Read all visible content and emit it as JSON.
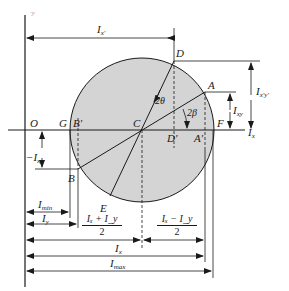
{
  "diagram": {
    "colors": {
      "circle_fill": "#d4d4d4",
      "line": "#1a1a1a",
      "background": "#ffffff"
    },
    "axes": {
      "vertical_label": "I_xy",
      "vertical_label_text": "·y",
      "horizontal_label": "I",
      "horizontal_label_sub": "x"
    },
    "points": {
      "O": "O",
      "G": "G",
      "B_prime": "B′",
      "C": "C",
      "D_prime": "D′",
      "A_prime": "A′",
      "F": "F",
      "D": "D",
      "A": "A",
      "B": "B",
      "E": "E"
    },
    "angles": {
      "two_theta": "2θ",
      "two_beta": "2β"
    },
    "dimensions": {
      "Ixprime": {
        "main": "I",
        "sub": "x′"
      },
      "Ixprimeyprime": {
        "main": "I",
        "sub": "x′y′"
      },
      "Ixy": {
        "main": "I",
        "sub": "xy"
      },
      "neg_Ixy": {
        "main": "−I",
        "sub": "xy"
      },
      "Imin": {
        "main": "I",
        "sub": "min"
      },
      "Iy": {
        "main": "I",
        "sub": "y"
      },
      "sum_half": {
        "numerator": "Iₓ + I_y",
        "denominator": "2"
      },
      "diff_half": {
        "numerator": "Iₓ − I_y",
        "denominator": "2"
      },
      "Ix": {
        "main": "I",
        "sub": "x"
      },
      "Imax": {
        "main": "I",
        "sub": "max"
      }
    }
  }
}
